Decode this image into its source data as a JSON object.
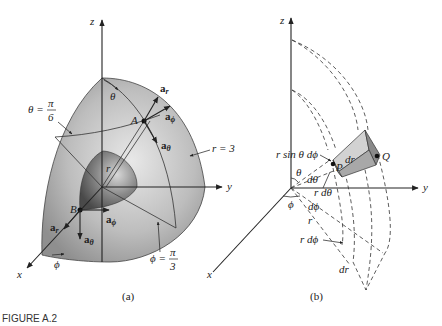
{
  "figure": {
    "caption": "FIGURE A.2",
    "panels": [
      {
        "id": "a",
        "label": "(a)",
        "axes": {
          "x": "x",
          "y": "y",
          "z": "z"
        },
        "labels": {
          "theta_eq": "θ =",
          "theta_num": "π",
          "theta_den": "6",
          "theta": "θ",
          "phi_eq": "ϕ =",
          "phi_num": "π",
          "phi_den": "3",
          "phi": "ϕ",
          "r_eq": "r = 3",
          "r": "r",
          "point_A": "A",
          "point_B": "B"
        },
        "unit_vectors_A": {
          "ar": "a",
          "ar_sub": "r",
          "aphi": "a",
          "aphi_sub": "ϕ",
          "atheta": "a",
          "atheta_sub": "θ"
        },
        "unit_vectors_B": {
          "ar": "a",
          "ar_sub": "r",
          "aphi": "a",
          "aphi_sub": "ϕ",
          "atheta": "a",
          "atheta_sub": "θ"
        },
        "colors": {
          "outer_surface": "#a9a9a9",
          "inner_surface": "#6e6e6e"
        }
      },
      {
        "id": "b",
        "label": "(b)",
        "axes": {
          "x": "x",
          "y": "y",
          "z": "z"
        },
        "labels": {
          "r_sin_theta_dphi": "r sin θ dϕ",
          "point_P": "P",
          "point_Q": "Q",
          "dr_top": "dr",
          "theta": "θ",
          "dtheta": "dθ",
          "r_dtheta": "r dθ",
          "phi": "ϕ",
          "dphi": "dϕ",
          "r": "r",
          "r_dphi": "r dϕ",
          "dr_bottom": "dr"
        },
        "colors": {
          "volume_top": "#c8c8c8",
          "volume_side": "#8a8a8a",
          "volume_front": "#a5a5a5"
        }
      }
    ]
  }
}
